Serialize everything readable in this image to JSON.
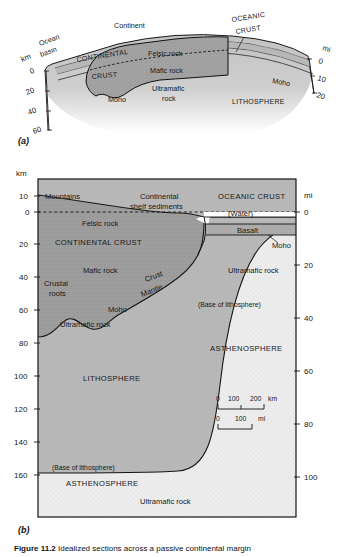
{
  "figure": {
    "caption_label": "Figure 11.2",
    "caption_text": "Idealized sections across a passive continental margin",
    "panel_a_label": "(a)",
    "panel_b_label": "(b)"
  },
  "panel_a": {
    "axis_left_unit": "km",
    "axis_left_ticks": [
      "0",
      "20",
      "40",
      "60"
    ],
    "axis_right_unit": "mi",
    "axis_right_ticks": [
      "0",
      "10",
      "20"
    ],
    "labels": {
      "ocean_basin": "Ocean\nbasin",
      "ocean_basin_l1": "Ocean",
      "ocean_basin_l2": "basin",
      "continent": "Continent",
      "continental_crust_l1": "CONTINENTAL",
      "continental_crust_l2": "CRUST",
      "felsic_rock": "Felsic rock",
      "mafic_rock": "Mafic rock",
      "ultramafic_rock_l1": "Ultramafic",
      "ultramafic_rock_l2": "rock",
      "moho_left": "Moho",
      "moho_right": "Moho",
      "oceanic_crust_l1": "OCEANIC",
      "oceanic_crust_l2": "CRUST",
      "lithosphere": "LITHOSPHERE"
    }
  },
  "panel_b": {
    "axis_left_unit": "km",
    "axis_left_ticks": [
      "10",
      "0",
      "20",
      "40",
      "60",
      "80",
      "100",
      "120",
      "140",
      "160"
    ],
    "axis_right_unit": "mi",
    "axis_right_ticks": [
      "0",
      "20",
      "40",
      "60",
      "80",
      "100"
    ],
    "labels": {
      "mountains": "Mountains",
      "continental_shelf_l1": "Continental",
      "continental_shelf_l2": "shelf sediments",
      "oceanic_crust": "OCEANIC CRUST",
      "water": "(Water)",
      "basalt": "Basalt",
      "felsic_rock": "Felsic rock",
      "continental_crust": "CONTINENTAL CRUST",
      "mafic_rock": "Mafic rock",
      "moho_right": "Moho",
      "ultramafic_rock_upper": "Ultramafic rock",
      "crust": "Crust",
      "mantle": "Mantle",
      "crustal_roots_l1": "Crustal",
      "crustal_roots_l2": "roots",
      "moho_center": "Moho",
      "ultramafic_rock_mid": "Ultramafic rock",
      "base_of_lithosphere_right": "(Base of lithosphere)",
      "asthenosphere_right": "ASTHENOSPHERE",
      "lithosphere": "LITHOSPHERE",
      "base_of_lithosphere_left": "(Base of lithosphere)",
      "asthenosphere_left": "ASTHENOSPHERE",
      "ultramafic_rock_bottom": "Ultramafic rock"
    },
    "scale_bar": {
      "km_ticks": [
        "0",
        "100",
        "200"
      ],
      "km_unit": "km",
      "mi_ticks": [
        "0",
        "100"
      ],
      "mi_unit": "mi"
    }
  },
  "colors": {
    "continental_crust": "#9c9c9c",
    "mantle_lithosphere": "#b8b8b8",
    "asthenosphere": "#e8e8e8",
    "oceanic_crust": "#aaaaaa",
    "water": "#ffffff",
    "sediment": "#b0b0b0",
    "line": "#1a1a1a",
    "background": "#ffffff"
  }
}
